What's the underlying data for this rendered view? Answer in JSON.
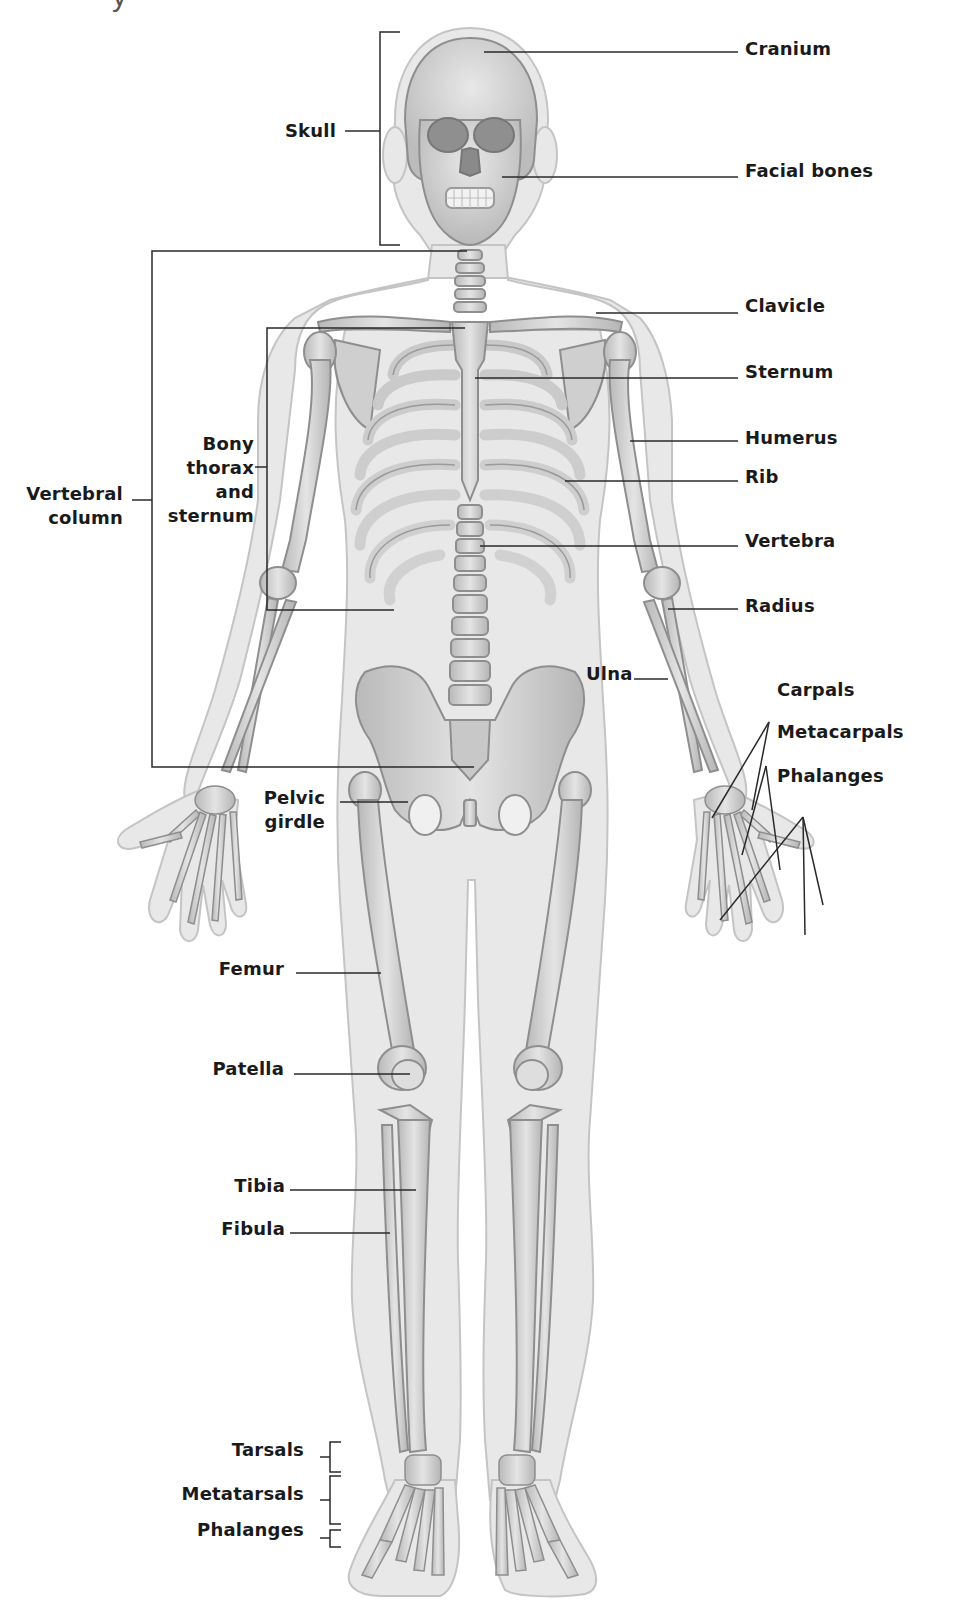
{
  "diagram": {
    "title_fragment": "y",
    "colors": {
      "background": "#ffffff",
      "skin_fill": "#e6e6e6",
      "skin_stroke": "#bdbdbd",
      "bone_fill": "#d2d2d2",
      "bone_stroke": "#8e8e8e",
      "leader_line": "#2a2a2a",
      "label_text": "#1a1a1a"
    },
    "labels_left": [
      {
        "id": "skull",
        "text": "Skull"
      },
      {
        "id": "vertebral-column",
        "lines": [
          "Vertebral",
          "column"
        ]
      },
      {
        "id": "bony-thorax",
        "lines": [
          "Bony",
          "thorax",
          "and",
          "sternum"
        ]
      },
      {
        "id": "pelvic-girdle",
        "lines": [
          "Pelvic",
          "girdle"
        ]
      },
      {
        "id": "femur",
        "text": "Femur"
      },
      {
        "id": "patella",
        "text": "Patella"
      },
      {
        "id": "tibia",
        "text": "Tibia"
      },
      {
        "id": "fibula",
        "text": "Fibula"
      },
      {
        "id": "tarsals",
        "text": "Tarsals"
      },
      {
        "id": "metatarsals",
        "text": "Metatarsals"
      },
      {
        "id": "foot-phalanges",
        "text": "Phalanges"
      }
    ],
    "labels_right": [
      {
        "id": "cranium",
        "text": "Cranium"
      },
      {
        "id": "facial-bones",
        "text": "Facial bones"
      },
      {
        "id": "clavicle",
        "text": "Clavicle"
      },
      {
        "id": "sternum",
        "text": "Sternum"
      },
      {
        "id": "humerus",
        "text": "Humerus"
      },
      {
        "id": "rib",
        "text": "Rib"
      },
      {
        "id": "vertebra",
        "text": "Vertebra"
      },
      {
        "id": "radius",
        "text": "Radius"
      },
      {
        "id": "ulna",
        "text": "Ulna"
      },
      {
        "id": "carpals",
        "text": "Carpals"
      },
      {
        "id": "metacarpals",
        "text": "Metacarpals"
      },
      {
        "id": "hand-phalanges",
        "text": "Phalanges"
      }
    ]
  }
}
